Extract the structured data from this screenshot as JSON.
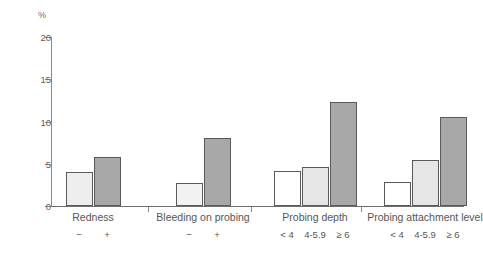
{
  "chart_data": {
    "type": "bar",
    "title": "",
    "subtitle": "",
    "xlabel": "",
    "ylabel": "%",
    "ylim": [
      0,
      20
    ],
    "yticks": [
      0,
      5,
      10,
      15,
      20
    ],
    "ytick_labels": [
      "0",
      "5",
      "10",
      "15",
      "20"
    ],
    "grid": false,
    "legend": "none",
    "groups": [
      {
        "label": "Redness",
        "bars": [
          {
            "tick_label": "−",
            "value": 4.0,
            "fill": "#eeeeee"
          },
          {
            "tick_label": "+",
            "value": 5.8,
            "fill": "#a8a8a8"
          }
        ]
      },
      {
        "label": "Bleeding on probing",
        "bars": [
          {
            "tick_label": "−",
            "value": 2.7,
            "fill": "#f2f2f2"
          },
          {
            "tick_label": "+",
            "value": 8.0,
            "fill": "#a8a8a8"
          }
        ]
      },
      {
        "label": "Probing depth",
        "bars": [
          {
            "tick_label": "< 4",
            "value": 4.1,
            "fill": "#ffffff"
          },
          {
            "tick_label": "4-5.9",
            "value": 4.6,
            "fill": "#e6e6e6"
          },
          {
            "tick_label": "≥ 6",
            "value": 12.3,
            "fill": "#a8a8a8"
          }
        ]
      },
      {
        "label": "Probing attachment level",
        "bars": [
          {
            "tick_label": "< 4",
            "value": 2.9,
            "fill": "#ffffff"
          },
          {
            "tick_label": "4-5.9",
            "value": 5.5,
            "fill": "#e6e6e6"
          },
          {
            "tick_label": "≥ 6",
            "value": 10.5,
            "fill": "#a8a8a8"
          }
        ]
      }
    ],
    "colors": {
      "bar_outline": "#5a5a5a",
      "axis": "#8a8a8a",
      "text": "#555555"
    }
  }
}
